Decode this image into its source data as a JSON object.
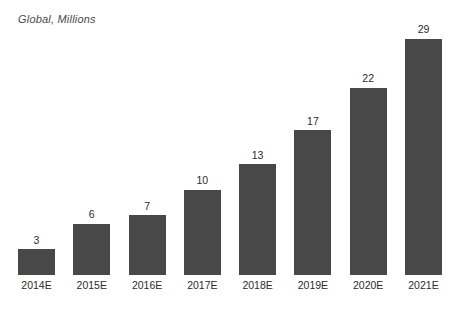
{
  "chart_data": {
    "type": "bar",
    "title": "Global, Millions",
    "xlabel": "",
    "ylabel": "",
    "categories": [
      "2014E",
      "2015E",
      "2016E",
      "2017E",
      "2018E",
      "2019E",
      "2020E",
      "2021E"
    ],
    "values": [
      3,
      6,
      7,
      10,
      13,
      17,
      22,
      29
    ],
    "value_labels": [
      "3",
      "6",
      "7",
      "10",
      "13",
      "17",
      "22",
      "29"
    ],
    "ylim": [
      0,
      29
    ],
    "grid": false,
    "legend": false,
    "legend_position": "none",
    "series": [
      {
        "name": "Global, Millions",
        "values": [
          3,
          6,
          7,
          10,
          13,
          17,
          22,
          29
        ],
        "color": "#484848"
      }
    ],
    "colors": {
      "bar": "#484848",
      "background": "#ffffff",
      "title_text": "#4a4a4a",
      "label_text": "#2b2b2b"
    }
  }
}
